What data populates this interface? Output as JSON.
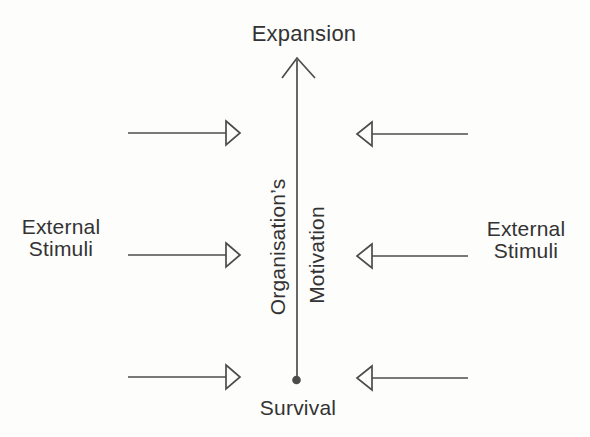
{
  "colors": {
    "background": "#fdfdfc",
    "line": "#4c4c4c",
    "text": "#333333"
  },
  "diagram": {
    "top_label": "Expansion",
    "bottom_label": "Survival",
    "axis": {
      "left_text": "Organisation’s",
      "right_text": "Motivation"
    },
    "left_stimuli": {
      "line1": "External",
      "line2": "Stimuli"
    },
    "right_stimuli": {
      "line1": "External",
      "line2": "Stimuli"
    }
  }
}
